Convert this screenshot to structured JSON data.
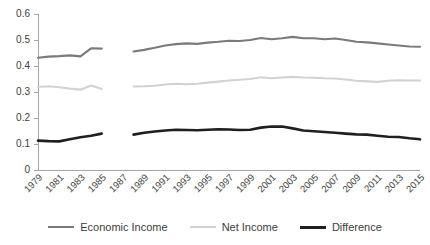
{
  "chart_data": {
    "type": "line",
    "title": "",
    "xlabel": "",
    "ylabel": "",
    "ylim": [
      0,
      0.6
    ],
    "ytick_labels": [
      "0",
      "0.1",
      "0.2",
      "0.3",
      "0.4",
      "0.5",
      "0.6"
    ],
    "ytick_values": [
      0,
      0.1,
      0.2,
      0.3,
      0.4,
      0.5,
      0.6
    ],
    "grid": false,
    "legend_position": "bottom",
    "x_all": [
      1979,
      1980,
      1981,
      1982,
      1983,
      1984,
      1985,
      1986,
      1987,
      1988,
      1989,
      1990,
      1991,
      1992,
      1993,
      1994,
      1995,
      1996,
      1997,
      1998,
      1999,
      2000,
      2001,
      2002,
      2003,
      2004,
      2005,
      2006,
      2007,
      2008,
      2009,
      2010,
      2011,
      2012,
      2013,
      2014,
      2015
    ],
    "xtick_labels": [
      "1979",
      "1981",
      "1983",
      "1985",
      "1987",
      "1989",
      "1991",
      "1993",
      "1995",
      "1997",
      "1999",
      "2001",
      "2003",
      "2005",
      "2007",
      "2009",
      "2011",
      "2013",
      "2015"
    ],
    "xtick_values": [
      1979,
      1981,
      1983,
      1985,
      1987,
      1989,
      1991,
      1993,
      1995,
      1997,
      1999,
      2001,
      2003,
      2005,
      2007,
      2009,
      2011,
      2013,
      2015
    ],
    "data_gap": [
      1986,
      1987
    ],
    "series": [
      {
        "name": "Economic Income",
        "color": "#7a7a7a",
        "x": [
          1979,
          1980,
          1981,
          1982,
          1983,
          1984,
          1985,
          1988,
          1989,
          1990,
          1991,
          1992,
          1993,
          1994,
          1995,
          1996,
          1997,
          1998,
          1999,
          2000,
          2001,
          2002,
          2003,
          2004,
          2005,
          2006,
          2007,
          2008,
          2009,
          2010,
          2011,
          2012,
          2013,
          2014,
          2015
        ],
        "values": [
          0.432,
          0.436,
          0.438,
          0.441,
          0.437,
          0.468,
          0.467,
          0.456,
          0.462,
          0.47,
          0.479,
          0.484,
          0.487,
          0.485,
          0.49,
          0.493,
          0.497,
          0.496,
          0.5,
          0.508,
          0.503,
          0.507,
          0.512,
          0.507,
          0.507,
          0.503,
          0.506,
          0.5,
          0.493,
          0.491,
          0.487,
          0.483,
          0.479,
          0.475,
          0.474
        ]
      },
      {
        "name": "Net Income",
        "color": "#d2d2d2",
        "x": [
          1979,
          1980,
          1981,
          1982,
          1983,
          1984,
          1985,
          1988,
          1989,
          1990,
          1991,
          1992,
          1993,
          1994,
          1995,
          1996,
          1997,
          1998,
          1999,
          2000,
          2001,
          2002,
          2003,
          2004,
          2005,
          2006,
          2007,
          2008,
          2009,
          2010,
          2011,
          2012,
          2013,
          2014,
          2015
        ],
        "values": [
          0.319,
          0.322,
          0.318,
          0.313,
          0.309,
          0.325,
          0.312,
          0.321,
          0.322,
          0.324,
          0.329,
          0.332,
          0.33,
          0.332,
          0.336,
          0.34,
          0.344,
          0.347,
          0.35,
          0.357,
          0.353,
          0.356,
          0.358,
          0.356,
          0.355,
          0.353,
          0.352,
          0.348,
          0.343,
          0.341,
          0.339,
          0.343,
          0.345,
          0.344,
          0.344
        ]
      },
      {
        "name": "Difference",
        "color": "#1f1f1f",
        "x": [
          1979,
          1980,
          1981,
          1982,
          1983,
          1984,
          1985,
          1988,
          1989,
          1990,
          1991,
          1992,
          1993,
          1994,
          1995,
          1996,
          1997,
          1998,
          1999,
          2000,
          2001,
          2002,
          2003,
          2004,
          2005,
          2006,
          2007,
          2008,
          2009,
          2010,
          2011,
          2012,
          2013,
          2014,
          2015
        ],
        "values": [
          0.113,
          0.111,
          0.11,
          0.118,
          0.126,
          0.132,
          0.14,
          0.136,
          0.143,
          0.148,
          0.152,
          0.155,
          0.154,
          0.153,
          0.155,
          0.157,
          0.156,
          0.154,
          0.155,
          0.163,
          0.167,
          0.167,
          0.16,
          0.152,
          0.149,
          0.146,
          0.143,
          0.14,
          0.137,
          0.136,
          0.132,
          0.128,
          0.127,
          0.122,
          0.118
        ]
      }
    ]
  },
  "legend": {
    "items": [
      {
        "label": "Economic Income",
        "swatch": "economic"
      },
      {
        "label": "Net Income",
        "swatch": "net"
      },
      {
        "label": "Difference",
        "swatch": "diff"
      }
    ]
  }
}
